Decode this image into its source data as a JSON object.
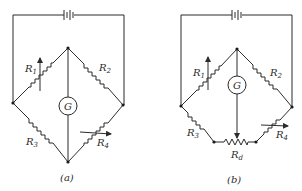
{
  "diagrams": [
    {
      "id": "a",
      "caption": "(a)",
      "components": {
        "R1": {
          "label": "R",
          "sub": "1",
          "variable": true
        },
        "R2": {
          "label": "R",
          "sub": "2",
          "variable": false
        },
        "R3": {
          "label": "R",
          "sub": "3",
          "variable": false
        },
        "R4": {
          "label": "R",
          "sub": "4",
          "variable": true
        },
        "G": {
          "label": "G"
        }
      }
    },
    {
      "id": "b",
      "caption": "(b)",
      "components": {
        "R1": {
          "label": "R",
          "sub": "1",
          "variable": true
        },
        "R2": {
          "label": "R",
          "sub": "2",
          "variable": false
        },
        "R3": {
          "label": "R",
          "sub": "3",
          "variable": false
        },
        "R4": {
          "label": "R",
          "sub": "4",
          "variable": true
        },
        "Rd": {
          "label": "R",
          "sub": "d",
          "variable": true
        },
        "G": {
          "label": "G"
        }
      }
    }
  ],
  "colors": {
    "line": "#2b2b2b",
    "background": "#ffffff"
  }
}
